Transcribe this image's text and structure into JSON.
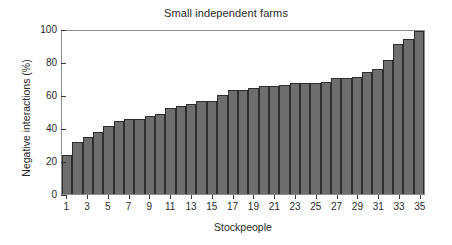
{
  "chart_data": {
    "type": "bar",
    "title": "Small independent farms",
    "xlabel": "Stockpeople",
    "ylabel": "Negative interactions (%)",
    "categories": [
      1,
      2,
      3,
      4,
      5,
      6,
      7,
      8,
      9,
      10,
      11,
      12,
      13,
      14,
      15,
      16,
      17,
      18,
      19,
      20,
      21,
      22,
      23,
      24,
      25,
      26,
      27,
      28,
      29,
      30,
      31,
      32,
      33,
      34,
      35
    ],
    "values": [
      24,
      32,
      35,
      38,
      42,
      45,
      46,
      46,
      48,
      49,
      53,
      54,
      55,
      57,
      57,
      61,
      64,
      64,
      65,
      66,
      66,
      67,
      68,
      68,
      68,
      69,
      71,
      71,
      72,
      75,
      77,
      82,
      92,
      95,
      100
    ],
    "series": [
      {
        "name": "Negative interactions",
        "values": [
          24,
          32,
          35,
          38,
          42,
          45,
          46,
          46,
          48,
          49,
          53,
          54,
          55,
          57,
          57,
          61,
          64,
          64,
          65,
          66,
          66,
          67,
          68,
          68,
          68,
          69,
          71,
          71,
          72,
          75,
          77,
          82,
          92,
          95,
          100
        ]
      }
    ],
    "ylim": [
      0,
      100
    ],
    "xlim": [
      0.5,
      35.5
    ],
    "yticks": [
      0,
      20,
      40,
      60,
      80,
      100
    ],
    "ytick_labels": [
      "0",
      "20",
      "40",
      "60",
      "80",
      "100"
    ],
    "xticks": [
      1,
      3,
      5,
      7,
      9,
      11,
      13,
      15,
      17,
      19,
      21,
      23,
      25,
      27,
      29,
      31,
      33,
      35
    ],
    "xtick_labels": [
      "1",
      "3",
      "5",
      "7",
      "9",
      "11",
      "13",
      "15",
      "17",
      "19",
      "21",
      "23",
      "25",
      "27",
      "29",
      "31",
      "33",
      "35"
    ],
    "grid": false,
    "legend": null,
    "bar_color": "#6e6e6e",
    "bar_edge_color": "#2e2e2e",
    "axis_color": "#8d8d8d",
    "background_color": "#ffffff"
  }
}
